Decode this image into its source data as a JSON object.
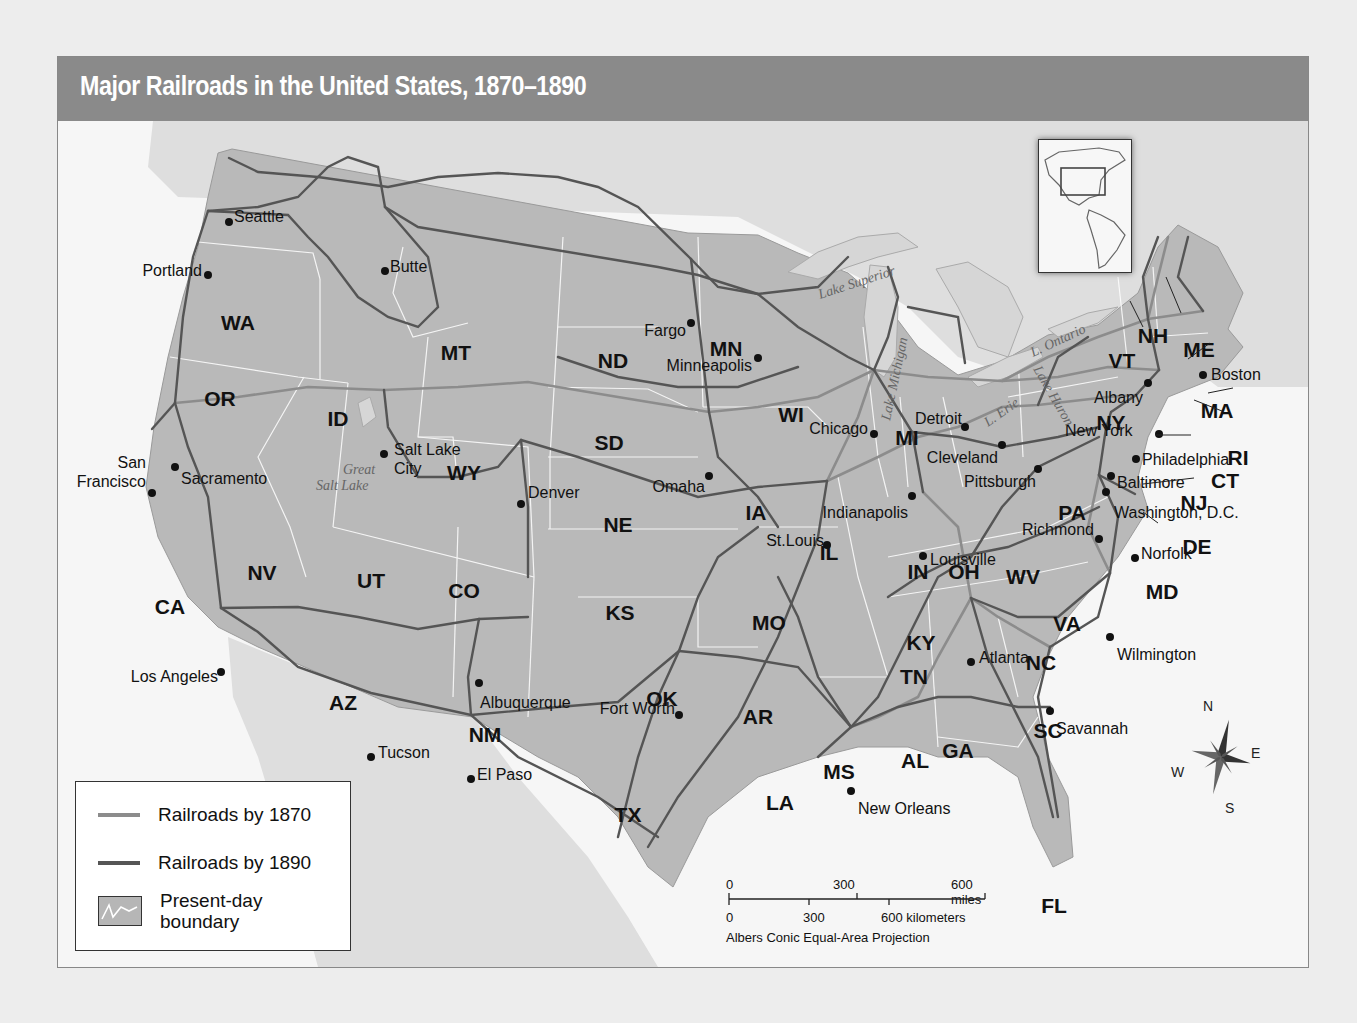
{
  "title": "Major Railroads in the United States, 1870–1890",
  "legend": {
    "items": [
      {
        "label": "Railroads by 1870",
        "color": "#8c8c8c"
      },
      {
        "label": "Railroads by 1890",
        "color": "#555555"
      },
      {
        "label": "Present-day boundary",
        "line1": "Present-day",
        "line2": "boundary"
      }
    ]
  },
  "scale_bar": {
    "miles_ticks": [
      "0",
      "300",
      "600 miles"
    ],
    "km_ticks": [
      "0",
      "300",
      "600 kilometers"
    ],
    "projection": "Albers Conic Equal-Area Projection"
  },
  "compass": {
    "n": "N",
    "e": "E",
    "s": "S",
    "w": "W"
  },
  "inset": {
    "name": "Western Hemisphere locator map"
  },
  "colors": {
    "title_bar": "#8a8a8a",
    "us_land": "#b9b9b9",
    "foreign_land": "#dcdcdc",
    "water": "#f6f6f6",
    "rail_1870": "#8c8c8c",
    "rail_1890": "#555555",
    "boundary": "#ffffff"
  },
  "states": [
    {
      "abbr": "WA",
      "x": 180,
      "y": 202
    },
    {
      "abbr": "OR",
      "x": 162,
      "y": 278
    },
    {
      "abbr": "CA",
      "x": 112,
      "y": 486
    },
    {
      "abbr": "ID",
      "x": 280,
      "y": 298
    },
    {
      "abbr": "NV",
      "x": 204,
      "y": 452
    },
    {
      "abbr": "UT",
      "x": 313,
      "y": 460
    },
    {
      "abbr": "AZ",
      "x": 285,
      "y": 582
    },
    {
      "abbr": "MT",
      "x": 398,
      "y": 232
    },
    {
      "abbr": "WY",
      "x": 406,
      "y": 352
    },
    {
      "abbr": "CO",
      "x": 406,
      "y": 470
    },
    {
      "abbr": "NM",
      "x": 427,
      "y": 614
    },
    {
      "abbr": "ND",
      "x": 555,
      "y": 240
    },
    {
      "abbr": "SD",
      "x": 551,
      "y": 322
    },
    {
      "abbr": "NE",
      "x": 560,
      "y": 404
    },
    {
      "abbr": "KS",
      "x": 562,
      "y": 492
    },
    {
      "abbr": "OK",
      "x": 604,
      "y": 578
    },
    {
      "abbr": "TX",
      "x": 570,
      "y": 694
    },
    {
      "abbr": "MN",
      "x": 668,
      "y": 228
    },
    {
      "abbr": "IA",
      "x": 698,
      "y": 392
    },
    {
      "abbr": "MO",
      "x": 711,
      "y": 502
    },
    {
      "abbr": "AR",
      "x": 700,
      "y": 596
    },
    {
      "abbr": "LA",
      "x": 722,
      "y": 682
    },
    {
      "abbr": "WI",
      "x": 733,
      "y": 294
    },
    {
      "abbr": "IL",
      "x": 771,
      "y": 432
    },
    {
      "abbr": "MS",
      "x": 781,
      "y": 651
    },
    {
      "abbr": "MI",
      "x": 849,
      "y": 317
    },
    {
      "abbr": "IN",
      "x": 860,
      "y": 451
    },
    {
      "abbr": "OH",
      "x": 906,
      "y": 451
    },
    {
      "abbr": "KY",
      "x": 863,
      "y": 522
    },
    {
      "abbr": "TN",
      "x": 856,
      "y": 556
    },
    {
      "abbr": "AL",
      "x": 857,
      "y": 640
    },
    {
      "abbr": "GA",
      "x": 900,
      "y": 630
    },
    {
      "abbr": "FL",
      "x": 996,
      "y": 785
    },
    {
      "abbr": "SC",
      "x": 990,
      "y": 610
    },
    {
      "abbr": "NC",
      "x": 983,
      "y": 542
    },
    {
      "abbr": "VA",
      "x": 1009,
      "y": 503
    },
    {
      "abbr": "WV",
      "x": 965,
      "y": 456
    },
    {
      "abbr": "PA",
      "x": 1014,
      "y": 392
    },
    {
      "abbr": "NY",
      "x": 1053,
      "y": 302
    },
    {
      "abbr": "VT",
      "x": 1064,
      "y": 240
    },
    {
      "abbr": "NH",
      "x": 1095,
      "y": 215
    },
    {
      "abbr": "ME",
      "x": 1141,
      "y": 229
    },
    {
      "abbr": "MA",
      "x": 1159,
      "y": 290
    },
    {
      "abbr": "RI",
      "x": 1180,
      "y": 337
    },
    {
      "abbr": "CT",
      "x": 1167,
      "y": 360
    },
    {
      "abbr": "NJ",
      "x": 1136,
      "y": 382
    },
    {
      "abbr": "DE",
      "x": 1139,
      "y": 426
    },
    {
      "abbr": "MD",
      "x": 1104,
      "y": 471
    }
  ],
  "cities": [
    {
      "name": "Seattle",
      "x": 171,
      "y": 101,
      "lx": 176,
      "ly": 96,
      "anchor": "start"
    },
    {
      "name": "Portland",
      "x": 150,
      "y": 154,
      "lx": 144,
      "ly": 150,
      "anchor": "end"
    },
    {
      "name": "Butte",
      "x": 327,
      "y": 150,
      "lx": 332,
      "ly": 146,
      "anchor": "start"
    },
    {
      "name": "Sacramento",
      "x": 117,
      "y": 346,
      "lx": 123,
      "ly": 358,
      "anchor": "start"
    },
    {
      "name": "San",
      "x": 94,
      "y": 372,
      "lx": 88,
      "ly": 342,
      "anchor": "end"
    },
    {
      "name": "Francisco",
      "x": 94,
      "y": 372,
      "lx": 88,
      "ly": 361,
      "anchor": "end"
    },
    {
      "name": "Salt Lake",
      "x": 326,
      "y": 333,
      "lx": 336,
      "ly": 329,
      "anchor": "start"
    },
    {
      "name": "City",
      "x": 326,
      "y": 333,
      "lx": 336,
      "ly": 348,
      "anchor": "start"
    },
    {
      "name": "Denver",
      "x": 463,
      "y": 383,
      "lx": 470,
      "ly": 372,
      "anchor": "start"
    },
    {
      "name": "Los Angeles",
      "x": 163,
      "y": 551,
      "lx": 160,
      "ly": 556,
      "anchor": "end"
    },
    {
      "name": "Albuquerque",
      "x": 421,
      "y": 562,
      "lx": 422,
      "ly": 582,
      "anchor": "start"
    },
    {
      "name": "Tucson",
      "x": 313,
      "y": 636,
      "lx": 320,
      "ly": 632,
      "anchor": "start"
    },
    {
      "name": "El Paso",
      "x": 413,
      "y": 658,
      "lx": 419,
      "ly": 654,
      "anchor": "start"
    },
    {
      "name": "Fargo",
      "x": 633,
      "y": 202,
      "lx": 628,
      "ly": 210,
      "anchor": "end"
    },
    {
      "name": "Minneapolis",
      "x": 700,
      "y": 237,
      "lx": 694,
      "ly": 245,
      "anchor": "end"
    },
    {
      "name": "Omaha",
      "x": 651,
      "y": 355,
      "lx": 647,
      "ly": 366,
      "anchor": "end"
    },
    {
      "name": "Chicago",
      "x": 816,
      "y": 313,
      "lx": 810,
      "ly": 308,
      "anchor": "end"
    },
    {
      "name": "St.Louis",
      "x": 769,
      "y": 424,
      "lx": 766,
      "ly": 420,
      "anchor": "end"
    },
    {
      "name": "Indianapolis",
      "x": 854,
      "y": 375,
      "lx": 850,
      "ly": 392,
      "anchor": "end"
    },
    {
      "name": "Detroit",
      "x": 907,
      "y": 306,
      "lx": 904,
      "ly": 298,
      "anchor": "end"
    },
    {
      "name": "Cleveland",
      "x": 944,
      "y": 324,
      "lx": 940,
      "ly": 337,
      "anchor": "end"
    },
    {
      "name": "Pittsburgh",
      "x": 980,
      "y": 348,
      "lx": 978,
      "ly": 361,
      "anchor": "end"
    },
    {
      "name": "Louisville",
      "x": 865,
      "y": 435,
      "lx": 872,
      "ly": 439,
      "anchor": "start"
    },
    {
      "name": "Richmond",
      "x": 1041,
      "y": 418,
      "lx": 1036,
      "ly": 409,
      "anchor": "end"
    },
    {
      "name": "Norfolk",
      "x": 1077,
      "y": 437,
      "lx": 1083,
      "ly": 433,
      "anchor": "start"
    },
    {
      "name": "Washington, D.C.",
      "x": 1048,
      "y": 371,
      "lx": 1056,
      "ly": 392,
      "anchor": "start"
    },
    {
      "name": "Baltimore",
      "x": 1053,
      "y": 355,
      "lx": 1059,
      "ly": 362,
      "anchor": "start"
    },
    {
      "name": "Philadelphia",
      "x": 1078,
      "y": 338,
      "lx": 1084,
      "ly": 339,
      "anchor": "start"
    },
    {
      "name": "New York",
      "x": 1101,
      "y": 313,
      "lx": 1007,
      "ly": 310,
      "anchor": "start"
    },
    {
      "name": "Albany",
      "x": 1090,
      "y": 262,
      "lx": 1085,
      "ly": 277,
      "anchor": "end"
    },
    {
      "name": "Boston",
      "x": 1145,
      "y": 254,
      "lx": 1153,
      "ly": 254,
      "anchor": "start"
    },
    {
      "name": "Atlanta",
      "x": 913,
      "y": 541,
      "lx": 921,
      "ly": 537,
      "anchor": "start"
    },
    {
      "name": "Wilmington",
      "x": 1052,
      "y": 516,
      "lx": 1059,
      "ly": 534,
      "anchor": "start"
    },
    {
      "name": "Savannah",
      "x": 992,
      "y": 590,
      "lx": 998,
      "ly": 608,
      "anchor": "start"
    },
    {
      "name": "Fort Worth",
      "x": 621,
      "y": 594,
      "lx": 617,
      "ly": 588,
      "anchor": "end"
    },
    {
      "name": "New Orleans",
      "x": 793,
      "y": 670,
      "lx": 800,
      "ly": 688,
      "anchor": "start"
    }
  ],
  "lakes": [
    {
      "name": "Lake Superior",
      "x": 762,
      "y": 178,
      "rot": -18
    },
    {
      "name": "Lake Michigan",
      "x": 832,
      "y": 300,
      "rot": -78
    },
    {
      "name": "Lake Huron",
      "x": 975,
      "y": 248,
      "rot": 60
    },
    {
      "name": "L. Ontario",
      "x": 975,
      "y": 236,
      "rot": -25
    },
    {
      "name": "L. Erie",
      "x": 930,
      "y": 306,
      "rot": -35
    },
    {
      "name": "Great",
      "x": 285,
      "y": 353,
      "rot": 0
    },
    {
      "name": "Salt Lake",
      "x": 258,
      "y": 369,
      "rot": 0
    }
  ]
}
